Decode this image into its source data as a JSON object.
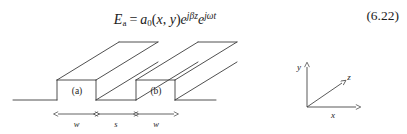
{
  "equation": {
    "lhs_symbol": "E",
    "lhs_subscript": "a",
    "equals": "=",
    "amplitude_symbol": "a",
    "amplitude_subscript": "0",
    "open_paren": "(",
    "var_x": "x",
    "comma": ", ",
    "var_y": "y",
    "close_paren": ")",
    "exp_base_1": "e",
    "exp_power_1": "jβz",
    "exp_base_2": "e",
    "exp_power_2": "jωt",
    "number": "(6.22)",
    "plain_text": "E_a = a_0(x, y)e^{jβz}e^{jωt}"
  },
  "figure": {
    "caption_labels": {
      "waveguide_a": "(a)",
      "waveguide_b": "(b)"
    },
    "dimensions": [
      {
        "name": "rib-width-a",
        "label": "w"
      },
      {
        "name": "gap-separation",
        "label": "s"
      },
      {
        "name": "rib-width-b",
        "label": "w"
      }
    ],
    "axes": {
      "y_label": "y",
      "z_label": "z",
      "x_label": "x"
    },
    "colors": {
      "line": "#3c3c3c",
      "baseline": "#4a4a4a",
      "text": "#232323",
      "background": "#ffffff"
    }
  }
}
